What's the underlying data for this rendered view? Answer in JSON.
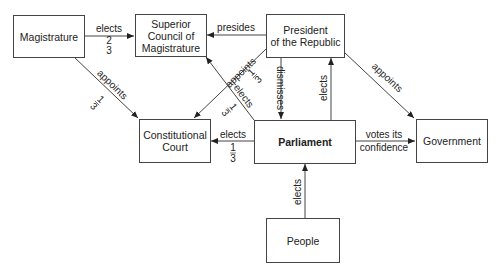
{
  "diagram": {
    "nodes": [
      {
        "id": "magistrature",
        "label": "Magistrature",
        "bold": false
      },
      {
        "id": "superior_council",
        "label": "Superior\nCouncil of\nMagistrature",
        "bold": false
      },
      {
        "id": "president",
        "label": "President\nof the Republic",
        "bold": false
      },
      {
        "id": "constitutional_court",
        "label": "Constitutional\nCourt",
        "bold": false
      },
      {
        "id": "parliament",
        "label": "Parliament",
        "bold": true
      },
      {
        "id": "government",
        "label": "Government",
        "bold": false
      },
      {
        "id": "people",
        "label": "People",
        "bold": false
      }
    ],
    "edges": [
      {
        "from": "magistrature",
        "to": "superior_council",
        "label": "elects",
        "fraction": "2/3"
      },
      {
        "from": "president",
        "to": "superior_council",
        "label": "presides"
      },
      {
        "from": "magistrature",
        "to": "constitutional_court",
        "label": "appoints",
        "fraction": "1/3"
      },
      {
        "from": "president",
        "to": "constitutional_court",
        "label": "appoints",
        "fraction": "1/3"
      },
      {
        "from": "parliament",
        "to": "superior_council",
        "label": "elects",
        "fraction": "1/3"
      },
      {
        "from": "president",
        "to": "parliament",
        "label": "dismisses"
      },
      {
        "from": "parliament",
        "to": "president",
        "label": "elects"
      },
      {
        "from": "president",
        "to": "government",
        "label": "appoints"
      },
      {
        "from": "parliament",
        "to": "constitutional_court",
        "label": "elects",
        "fraction": "1/3"
      },
      {
        "from": "parliament",
        "to": "government",
        "label": "votes its\nconfidence"
      },
      {
        "from": "people",
        "to": "parliament",
        "label": "elects"
      }
    ],
    "labels": {
      "mag_sc_elects": "elects",
      "mag_sc_num": "2",
      "mag_sc_den": "3",
      "pres_sc_presides": "presides",
      "mag_cc_appoints": "appoints",
      "mag_cc_num": "1",
      "mag_cc_den": "3",
      "pres_cc_appoints": "appoints",
      "pres_cc_num": "1",
      "pres_cc_den": "3",
      "parl_sc_elects": "elects",
      "parl_sc_num": "1",
      "parl_sc_den": "3",
      "pres_parl_dismisses": "dismisses",
      "parl_pres_elects": "elects",
      "pres_gov_appoints": "appoints",
      "parl_cc_elects": "elects",
      "parl_cc_num": "1",
      "parl_cc_den": "3",
      "parl_gov_votes_line1": "votes its",
      "parl_gov_votes_line2": "confidence",
      "people_parl_elects": "elects"
    }
  }
}
